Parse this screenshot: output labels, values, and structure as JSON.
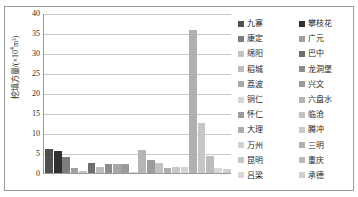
{
  "chart_data": {
    "type": "bar",
    "title": "",
    "subtitle": "",
    "xlabel": "",
    "ylabel": "挖填方量/(×10⁴m³)",
    "ylabel_main": "挖填方量/(×10",
    "ylabel_sup": "4",
    "ylabel_tail": "m³)",
    "ylim": [
      0,
      40
    ],
    "ytick_step": 5,
    "yticks": [
      40,
      35,
      30,
      25,
      20,
      15,
      10,
      5,
      0
    ],
    "grid": "horizontal",
    "legend_position": "right",
    "legend_columns": 2,
    "categories": [
      "九寨",
      "攀枝花",
      "康定",
      "广元",
      "绵阳",
      "巴中",
      "稻城",
      "龙洞堡",
      "荔波",
      "兴文",
      "铜仁",
      "六盘水",
      "怀仁",
      "临沧",
      "大理",
      "腾冲",
      "万州",
      "三明",
      "昆明",
      "重庆",
      "吕梁",
      "承德"
    ],
    "values": [
      6.0,
      5.4,
      3.9,
      1.3,
      0.4,
      2.5,
      1.5,
      2.2,
      2.2,
      2.3,
      0.1,
      5.8,
      3.3,
      2.4,
      1.3,
      1.4,
      1.4,
      35.8,
      12.5,
      4.3,
      1.2,
      1.0
    ],
    "colors": [
      "#4f4f4f",
      "#303030",
      "#7d7d7d",
      "#9f9f9f",
      "#c4c4c4",
      "#6e6e6e",
      "#bdbdbd",
      "#8c8c8c",
      "#a8a8a8",
      "#9b9b9b",
      "#d6d6d6",
      "#b5b5b5",
      "#9c9c9c",
      "#c2c2c2",
      "#aeaeae",
      "#c9c9c9",
      "#d2d2d2",
      "#b0b0b0",
      "#c6c6c6",
      "#bcbcbc",
      "#d9d9d9",
      "#cfcfcf"
    ]
  },
  "legend": {
    "left_column": [
      {
        "label": "九寨",
        "color": "#4f4f4f"
      },
      {
        "label": "康定",
        "color": "#7d7d7d"
      },
      {
        "label": "绵阳",
        "color": "#c4c4c4"
      },
      {
        "label": "稻城",
        "color": "#bdbdbd"
      },
      {
        "label": "荔波",
        "color": "#a8a8a8"
      },
      {
        "label": "铜仁",
        "color": "#d6d6d6"
      },
      {
        "label": "怀仁",
        "color": "#9c9c9c"
      },
      {
        "label": "大理",
        "color": "#aeaeae"
      },
      {
        "label": "万州",
        "color": "#d2d2d2"
      },
      {
        "label": "昆明",
        "color": "#c6c6c6"
      },
      {
        "label": "吕梁",
        "color": "#d9d9d9"
      }
    ],
    "right_column": [
      {
        "label": "攀枝花",
        "color": "#303030"
      },
      {
        "label": "广元",
        "color": "#9f9f9f"
      },
      {
        "label": "巴中",
        "color": "#6e6e6e"
      },
      {
        "label": "龙洞堡",
        "color": "#8c8c8c"
      },
      {
        "label": "兴文",
        "color": "#9b9b9b"
      },
      {
        "label": "六盘水",
        "color": "#b5b5b5"
      },
      {
        "label": "临沧",
        "color": "#c2c2c2"
      },
      {
        "label": "腾冲",
        "color": "#c9c9c9"
      },
      {
        "label": "三明",
        "color": "#b0b0b0"
      },
      {
        "label": "重庆",
        "color": "#bcbcbc"
      },
      {
        "label": "承德",
        "color": "#cfcfcf"
      }
    ]
  },
  "style": {
    "frame_color": "#9a9a9a",
    "grid_color": "#c8c8c8",
    "axis_color": "#9a9a9a",
    "text_color": "#2b2b2b",
    "background": "#ffffff"
  }
}
